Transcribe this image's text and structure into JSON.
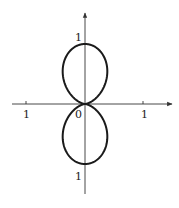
{
  "chart_data": {
    "type": "line",
    "title": "",
    "equation": "r = sin^2(theta)",
    "xlabel": "",
    "ylabel": "",
    "xlim": [
      -1.25,
      1.5
    ],
    "ylim": [
      -1.55,
      1.6
    ],
    "grid": false,
    "legend": null,
    "x_tick_labels": [
      {
        "value": -1,
        "label": "1"
      },
      {
        "value": 0,
        "label": "0"
      },
      {
        "value": 1,
        "label": "1"
      }
    ],
    "y_tick_labels": [
      {
        "value": 1,
        "label": "1"
      },
      {
        "value": -1,
        "label": "1"
      }
    ],
    "series": [
      {
        "name": "r = sin^2(theta)",
        "points_sampled": [
          {
            "x": 0,
            "y": 0
          },
          {
            "x": 0.35,
            "y": 0.2
          },
          {
            "x": 0.65,
            "y": 0.56
          },
          {
            "x": 0.55,
            "y": 0.85
          },
          {
            "x": 0,
            "y": 1
          },
          {
            "x": -0.55,
            "y": 0.85
          },
          {
            "x": -0.65,
            "y": 0.56
          },
          {
            "x": -0.35,
            "y": 0.2
          },
          {
            "x": 0,
            "y": 0
          },
          {
            "x": 0.35,
            "y": -0.2
          },
          {
            "x": 0.65,
            "y": -0.56
          },
          {
            "x": 0.55,
            "y": -0.85
          },
          {
            "x": 0,
            "y": -1
          },
          {
            "x": -0.55,
            "y": -0.85
          },
          {
            "x": -0.65,
            "y": -0.56
          },
          {
            "x": -0.35,
            "y": -0.2
          },
          {
            "x": 0,
            "y": 0
          }
        ]
      }
    ]
  },
  "labels": {
    "x_neg_one": "1",
    "origin": "0",
    "x_pos_one": "1",
    "y_pos_one": "1",
    "y_neg_one": "1"
  },
  "colors": {
    "curve": "#1a1a1a",
    "axes": "#333333"
  }
}
